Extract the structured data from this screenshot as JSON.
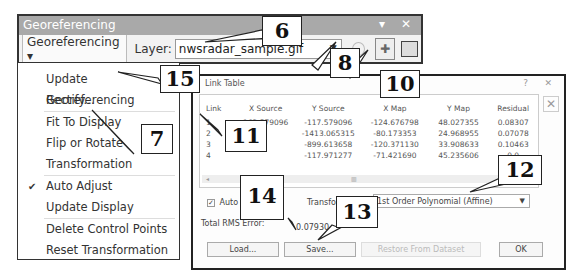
{
  "toolbar": {
    "title": "Georeferencing",
    "window_controls": "▾ ✕",
    "menu_button": "Georeferencing ▾",
    "layer_label": "Layer:",
    "layer_value": "nwsradar_sample.gif",
    "layer_arrow": "▼",
    "add_control_points_icon": "add-control-points-icon",
    "view_link_table_icon": "link-table-icon"
  },
  "menu": {
    "items": [
      {
        "label": "Update Georeferencing"
      },
      {
        "label": "Rectify..."
      },
      {
        "label": "Fit To Display"
      },
      {
        "label": "Flip or Rotate"
      },
      {
        "label": "Transformation"
      },
      {
        "label": "Auto Adjust",
        "checked": true
      },
      {
        "label": "Update Display"
      },
      {
        "label": "Delete Control Points"
      },
      {
        "label": "Reset Transformation"
      }
    ],
    "check_glyph": "✔"
  },
  "dialog": {
    "title": "Link Table",
    "help_glyph": "?",
    "close_glyph": "✕",
    "columns": [
      "Link",
      "X Source",
      "Y Source",
      "X Map",
      "Y Map",
      "Residual"
    ],
    "rows": [
      [
        "1",
        "162.579096",
        "-117.579096",
        "-124.676798",
        "48.027355",
        "0.08307"
      ],
      [
        "2",
        "",
        "-1413.065315",
        "-80.173353",
        "24.968955",
        "0.07078"
      ],
      [
        "3",
        "",
        "-899.613658",
        "-120.371130",
        "33.908633",
        "0.10463"
      ],
      [
        "4",
        "",
        "-117.971277",
        "-71.421690",
        "45.235606",
        "0.0"
      ]
    ],
    "scroll_left": "◂",
    "scroll_mid": "▥",
    "remove_glyph": "✕",
    "auto_adjust_label": "Auto Adjust",
    "auto_adjust_check": "✓",
    "transformation_label": "Transformation:",
    "transformation_value": "1st Order Polynomial (Affine)",
    "transformation_arrow": "▼",
    "rms_label": "Total RMS Error:",
    "rms_value": "0.07930",
    "buttons": {
      "load": "Load...",
      "save": "Save...",
      "restore": "Restore From Dataset",
      "ok": "OK"
    }
  },
  "callouts": {
    "c6": "6",
    "c7": "7",
    "c8": "8",
    "c10": "10",
    "c11": "11",
    "c12": "12",
    "c13": "13",
    "c14": "14",
    "c15": "15"
  }
}
